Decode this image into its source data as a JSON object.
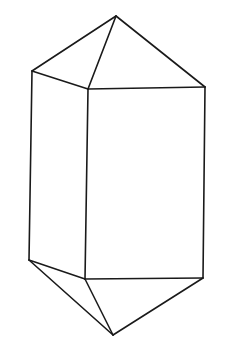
{
  "figure": {
    "title": "",
    "stroke_color": "#1a1a1a",
    "background": "#ffffff",
    "vertices": {
      "top_apex": [
        116,
        16
      ],
      "top_left": [
        32,
        71
      ],
      "top_front": [
        88,
        89
      ],
      "top_right": [
        205,
        87
      ],
      "bottom_left": [
        29,
        260
      ],
      "bottom_front": [
        85,
        279
      ],
      "bottom_right": [
        203,
        278
      ],
      "bottom_apex": [
        113,
        335
      ]
    },
    "edges": [
      [
        "top_apex",
        "top_left"
      ],
      [
        "top_apex",
        "top_front"
      ],
      [
        "top_apex",
        "top_right"
      ],
      [
        "top_left",
        "top_front"
      ],
      [
        "top_front",
        "top_right"
      ],
      [
        "top_left",
        "bottom_left"
      ],
      [
        "top_front",
        "bottom_front"
      ],
      [
        "top_right",
        "bottom_right"
      ],
      [
        "bottom_left",
        "bottom_front"
      ],
      [
        "bottom_front",
        "bottom_right"
      ],
      [
        "bottom_left",
        "bottom_apex"
      ],
      [
        "bottom_front",
        "bottom_apex"
      ],
      [
        "bottom_right",
        "bottom_apex"
      ]
    ]
  }
}
